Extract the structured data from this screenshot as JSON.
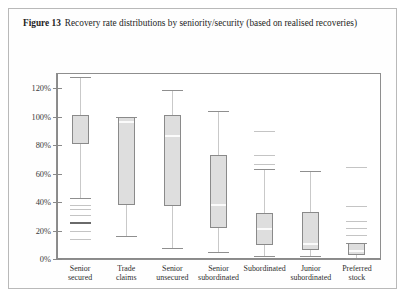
{
  "caption": {
    "figure_label": "Figure 13",
    "text": "Recovery rate distributions by seniority/security (based on realised recoveries)"
  },
  "chart_data": {
    "type": "box",
    "title": "Recovery rate distributions by seniority/security (based on realised recoveries)",
    "xlabel": "",
    "ylabel": "",
    "ylim": [
      0,
      130
    ],
    "grid": false,
    "legend": "none",
    "y_tick_labels": [
      "0%",
      "20%",
      "40%",
      "60%",
      "80%",
      "100%",
      "120%"
    ],
    "y_tick_values": [
      0,
      20,
      40,
      60,
      80,
      100,
      120
    ],
    "categories": [
      "Senior\nsecured",
      "Trade\nclaims",
      "Senior\nunsecured",
      "Senior\nsubordinated",
      "Subordinated",
      "Junior\nsubordinated",
      "Preferred\nstock"
    ],
    "boxes": [
      {
        "label": "Senior secured",
        "line1": "Senior",
        "line2": "secured",
        "whisker_high": 128,
        "q3": 101,
        "median": null,
        "q1": 81,
        "whisker_low": 43,
        "outliers": [
          38,
          35,
          31,
          26,
          20,
          14
        ],
        "highlighted_outliers": [
          26
        ]
      },
      {
        "label": "Trade claims",
        "line1": "Trade",
        "line2": "claims",
        "whisker_high": 100,
        "q3": 100,
        "median": 97,
        "q1": 38,
        "whisker_low": 16,
        "outliers": [],
        "highlighted_outliers": []
      },
      {
        "label": "Senior unsecured",
        "line1": "Senior",
        "line2": "unsecured",
        "whisker_high": 119,
        "q3": 101,
        "median": 87,
        "q1": 37,
        "whisker_low": 8,
        "outliers": [],
        "highlighted_outliers": []
      },
      {
        "label": "Senior subordinated",
        "line1": "Senior",
        "line2": "subordinated",
        "whisker_high": 104,
        "q3": 73,
        "median": 39,
        "q1": 22,
        "whisker_low": 5,
        "outliers": [],
        "highlighted_outliers": []
      },
      {
        "label": "Subordinated",
        "line1": "Subordinated",
        "line2": "",
        "whisker_high": 63,
        "q3": 32,
        "median": 22,
        "q1": 10,
        "whisker_low": 2,
        "outliers": [
          90,
          73,
          67
        ],
        "highlighted_outliers": []
      },
      {
        "label": "Junior subordinated",
        "line1": "Junior",
        "line2": "subordinated",
        "whisker_high": 62,
        "q3": 33,
        "median": 11,
        "q1": 6,
        "whisker_low": 2,
        "outliers": [],
        "highlighted_outliers": []
      },
      {
        "label": "Preferred stock",
        "line1": "Preferred",
        "line2": "stock",
        "whisker_high": 11,
        "q3": 11,
        "median": 6,
        "q1": 3,
        "whisker_low": 1,
        "outliers": [
          65,
          37,
          27,
          22,
          17
        ],
        "highlighted_outliers": []
      }
    ]
  },
  "colors": {
    "box_fill": "#dedede",
    "box_edge": "#8a8a8a",
    "whisker": "#c9c9c9",
    "median": "#fbfbfb",
    "outlier": "#c4c4c4",
    "frame": "#8e8e8e",
    "page_border": "#b9b9b9"
  }
}
